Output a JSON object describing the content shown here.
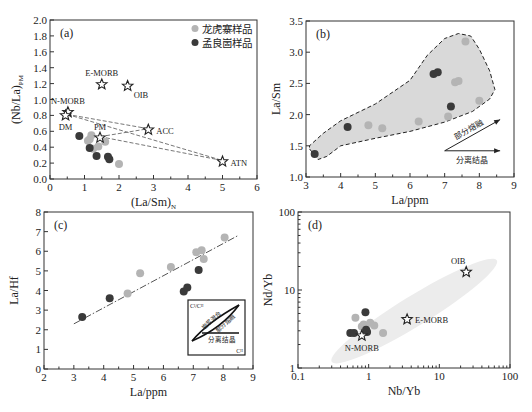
{
  "legend": {
    "items": [
      {
        "label": "龙虎寨样品",
        "color": "#b4b4b4"
      },
      {
        "label": "孟良崮样品",
        "color": "#3a3a3a"
      }
    ]
  },
  "chart_data": [
    {
      "panel": "(a)",
      "type": "scatter",
      "xlabel": "(La/Sm)",
      "xlabel_sub": "N",
      "ylabel": "(Nb/La)",
      "ylabel_sub": "PM",
      "xlim": [
        0,
        6
      ],
      "ylim": [
        0,
        2.0
      ],
      "xticks": [
        0,
        1,
        2,
        3,
        4,
        5,
        6
      ],
      "yticks": [
        0.0,
        0.2,
        0.4,
        0.6,
        0.8,
        1.0,
        1.2,
        1.4,
        1.6,
        1.8,
        2.0
      ],
      "ytick_labels": [
        "0.0",
        "0.2",
        "0.4",
        "0.6",
        "0.8",
        "1.0",
        "1.2",
        "1.4",
        "1.6",
        "1.8",
        "2.0"
      ],
      "legend_position": "top-right",
      "series": [
        {
          "name": "龙虎寨样品",
          "color": "#b4b4b4",
          "points": [
            [
              1.1,
              0.48
            ],
            [
              1.15,
              0.5
            ],
            [
              1.2,
              0.55
            ],
            [
              1.25,
              0.38
            ],
            [
              1.4,
              0.41
            ],
            [
              1.6,
              0.47
            ],
            [
              2.0,
              0.19
            ]
          ]
        },
        {
          "name": "孟良崮样品",
          "color": "#3a3a3a",
          "points": [
            [
              0.85,
              0.54
            ],
            [
              1.15,
              0.39
            ],
            [
              1.35,
              0.29
            ],
            [
              1.68,
              0.28
            ],
            [
              1.72,
              0.25
            ]
          ]
        }
      ],
      "references": [
        {
          "label": "E-MORB",
          "x": 1.5,
          "y": 1.19,
          "label_pos": "above"
        },
        {
          "label": "OIB",
          "x": 2.25,
          "y": 1.17,
          "label_pos": "below-right"
        },
        {
          "label": "N-MORB",
          "x": 0.52,
          "y": 0.84,
          "label_pos": "above"
        },
        {
          "label": "DM",
          "x": 0.45,
          "y": 0.8,
          "label_pos": "below"
        },
        {
          "label": "PM",
          "x": 1.45,
          "y": 0.52,
          "label_pos": "above"
        },
        {
          "label": "ACC",
          "x": 2.85,
          "y": 0.62,
          "label_pos": "right"
        },
        {
          "label": "ATN",
          "x": 5.0,
          "y": 0.22,
          "label_pos": "right"
        }
      ],
      "mixing_lines": [
        [
          [
            0.5,
            0.8
          ],
          [
            2.85,
            0.62
          ]
        ],
        [
          [
            0.5,
            0.8
          ],
          [
            5.0,
            0.22
          ]
        ],
        [
          [
            1.45,
            0.52
          ],
          [
            2.85,
            0.62
          ]
        ],
        [
          [
            1.45,
            0.52
          ],
          [
            5.0,
            0.22
          ]
        ]
      ]
    },
    {
      "panel": "(b)",
      "type": "scatter",
      "xlabel": "La/ppm",
      "ylabel": "La/Sm",
      "xlim": [
        3,
        9
      ],
      "ylim": [
        1.0,
        3.5
      ],
      "xticks": [
        3,
        4,
        5,
        6,
        7,
        8,
        9
      ],
      "yticks": [
        1.0,
        1.5,
        2.0,
        2.5,
        3.0,
        3.5
      ],
      "ytick_labels": [
        "1.0",
        "1.5",
        "2.0",
        "2.5",
        "3.0",
        "3.5"
      ],
      "series": [
        {
          "name": "龙虎寨样品",
          "color": "#b4b4b4",
          "points": [
            [
              4.8,
              1.83
            ],
            [
              5.2,
              1.78
            ],
            [
              6.25,
              1.89
            ],
            [
              7.1,
              1.97
            ],
            [
              7.3,
              2.52
            ],
            [
              7.4,
              2.54
            ],
            [
              7.6,
              3.17
            ],
            [
              8.0,
              2.22
            ]
          ]
        },
        {
          "name": "孟良崮样品",
          "color": "#3a3a3a",
          "points": [
            [
              3.25,
              1.37
            ],
            [
              4.2,
              1.8
            ],
            [
              6.68,
              2.65
            ],
            [
              6.8,
              2.68
            ],
            [
              7.18,
              2.13
            ]
          ]
        }
      ],
      "field_outline": [
        [
          3.1,
          1.45
        ],
        [
          3.35,
          1.28
        ],
        [
          3.6,
          1.33
        ],
        [
          4.0,
          1.5
        ],
        [
          5.0,
          1.62
        ],
        [
          6.0,
          1.73
        ],
        [
          7.0,
          1.88
        ],
        [
          7.8,
          2.05
        ],
        [
          8.3,
          2.25
        ],
        [
          8.45,
          2.4
        ],
        [
          8.3,
          2.7
        ],
        [
          8.0,
          3.05
        ],
        [
          7.75,
          3.26
        ],
        [
          7.4,
          3.3
        ],
        [
          7.0,
          3.22
        ],
        [
          6.5,
          2.95
        ],
        [
          6.0,
          2.55
        ],
        [
          5.0,
          2.17
        ],
        [
          4.0,
          1.9
        ],
        [
          3.5,
          1.7
        ],
        [
          3.1,
          1.5
        ]
      ],
      "arrows": [
        {
          "label": "部分熔融",
          "from": [
            7.0,
            1.42
          ],
          "to": [
            8.6,
            1.92
          ]
        },
        {
          "label": "分离结晶",
          "from": [
            7.0,
            1.42
          ],
          "to": [
            8.6,
            1.42
          ]
        }
      ]
    },
    {
      "panel": "(c)",
      "type": "scatter",
      "xlabel": "La/ppm",
      "ylabel": "La/Hf",
      "xlim": [
        2,
        9
      ],
      "ylim": [
        0,
        8
      ],
      "xticks": [
        2,
        3,
        4,
        5,
        6,
        7,
        8,
        9
      ],
      "yticks": [
        0,
        1,
        2,
        3,
        4,
        5,
        6,
        7,
        8
      ],
      "ytick_labels": [
        "0",
        "1",
        "2",
        "3",
        "4",
        "5",
        "6",
        "7",
        "8"
      ],
      "series": [
        {
          "name": "龙虎寨样品",
          "color": "#b4b4b4",
          "points": [
            [
              4.8,
              3.85
            ],
            [
              5.22,
              4.88
            ],
            [
              6.25,
              5.2
            ],
            [
              7.1,
              5.95
            ],
            [
              7.28,
              6.05
            ],
            [
              7.35,
              5.6
            ],
            [
              8.05,
              6.7
            ]
          ]
        },
        {
          "name": "孟良崮样品",
          "color": "#3a3a3a",
          "points": [
            [
              3.28,
              2.65
            ],
            [
              4.2,
              3.6
            ],
            [
              6.68,
              3.95
            ],
            [
              6.8,
              4.15
            ],
            [
              7.18,
              5.05
            ]
          ]
        }
      ],
      "trend_line": [
        [
          3.0,
          2.3
        ],
        [
          8.5,
          6.8
        ]
      ],
      "inset": {
        "y_label": "Cᴵ/Cᴴ",
        "x_label": "Cᴴ",
        "curve_labels": [
          "岩浆混合",
          "部分熔融"
        ],
        "flat_label": "分离结晶"
      }
    },
    {
      "panel": "(d)",
      "type": "scatter",
      "xscale": "log",
      "yscale": "log",
      "xlabel": "Nb/Yb",
      "ylabel": "Nd/Yb",
      "xlim": [
        0.1,
        100
      ],
      "ylim": [
        1,
        100
      ],
      "xticks": [
        0.1,
        1,
        10,
        100
      ],
      "xtick_labels": [
        "0.1",
        "1",
        "10",
        "100"
      ],
      "yticks": [
        1,
        10,
        100
      ],
      "ytick_labels": [
        "1",
        "10",
        "100"
      ],
      "series": [
        {
          "name": "龙虎寨样品",
          "color": "#b4b4b4",
          "points": [
            [
              0.65,
              4.4
            ],
            [
              0.8,
              3.4
            ],
            [
              0.85,
              3.6
            ],
            [
              1.05,
              3.8
            ],
            [
              1.2,
              3.5
            ],
            [
              1.6,
              2.8
            ]
          ]
        },
        {
          "name": "孟良崮样品",
          "color": "#3a3a3a",
          "points": [
            [
              0.55,
              2.8
            ],
            [
              0.62,
              2.8
            ],
            [
              0.9,
              5.2
            ],
            [
              0.92,
              3.1
            ],
            [
              0.95,
              2.9
            ]
          ]
        }
      ],
      "references": [
        {
          "label": "N-MORB",
          "x": 0.8,
          "y": 2.6,
          "label_pos": "below"
        },
        {
          "label": "E-MORB",
          "x": 3.5,
          "y": 4.2,
          "label_pos": "right"
        },
        {
          "label": "OIB",
          "x": 24,
          "y": 17,
          "label_pos": "above-left"
        }
      ],
      "array_band": {
        "from": [
          0.3,
          1.2
        ],
        "to": [
          65,
          24
        ]
      }
    }
  ]
}
